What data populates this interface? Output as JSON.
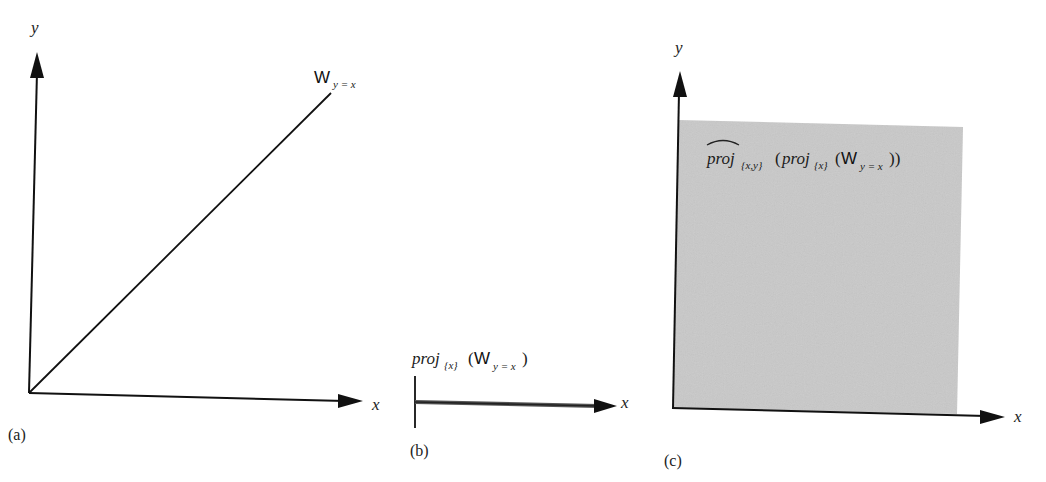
{
  "figure": {
    "panels": [
      {
        "id": "a",
        "label": "(a)",
        "x_axis_label": "x",
        "y_axis_label": "y",
        "line_label": {
          "main": "W",
          "subscript": "y = x"
        },
        "content": "diagonal line y = x from origin"
      },
      {
        "id": "b",
        "label": "(b)",
        "x_axis_label": "x",
        "projection_label": {
          "op": "proj",
          "op_subscript": "{x}",
          "open": "(",
          "arg": "W",
          "arg_subscript": "y = x",
          "close": ")"
        },
        "content": "thick segment along x axis"
      },
      {
        "id": "c",
        "label": "(c)",
        "x_axis_label": "x",
        "y_axis_label": "y",
        "region_label": {
          "outer_op": "proj",
          "outer_hat": "^",
          "outer_subscript": "{x,y}",
          "open_outer": "(",
          "inner_op": "proj",
          "inner_subscript": "{x}",
          "open_inner": "(",
          "arg": "W",
          "arg_subscript": "y = x",
          "close": "))"
        },
        "content": "shaded gray region filling the first quadrant"
      }
    ],
    "colors": {
      "ink": "#111111",
      "shade": "#c9c9c9",
      "background": "#ffffff"
    }
  }
}
